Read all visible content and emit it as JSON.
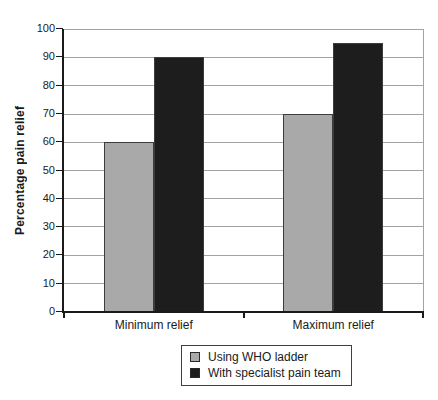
{
  "chart_data": {
    "type": "bar",
    "title": "",
    "categories": [
      "Minimum relief",
      "Maximum relief"
    ],
    "series": [
      {
        "name": "Using WHO ladder",
        "color": "#a9a9a9",
        "values": [
          60,
          70
        ]
      },
      {
        "name": "With specialist pain team",
        "color": "#1d1d1d",
        "values": [
          90,
          95
        ]
      }
    ],
    "xlabel": "",
    "ylabel": "Percentage pain relief",
    "ylim": [
      0,
      100
    ],
    "ytick_step": 10,
    "grid": true,
    "legend_position": "bottom-center",
    "colors": {
      "gridline": "#a3a3a3",
      "axis": "#1a1a1a",
      "background": "#ffffff",
      "text": "#1a1a1a"
    }
  }
}
